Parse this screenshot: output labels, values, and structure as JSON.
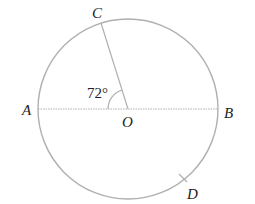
{
  "diagram": {
    "type": "circle-geometry",
    "points": {
      "A": "A",
      "B": "B",
      "C": "C",
      "D": "D",
      "O": "O"
    },
    "angle_label": "72°",
    "angle_value_degrees": 72
  },
  "colors": {
    "stroke": "#b0b0b0",
    "text": "#222222"
  }
}
